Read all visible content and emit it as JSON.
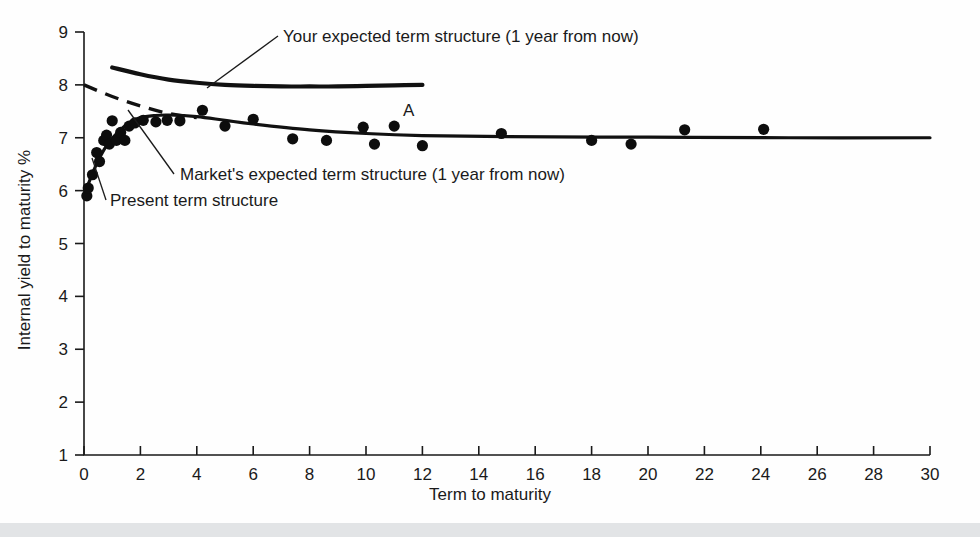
{
  "figure": {
    "background_color": "#fefefe",
    "foreground_color": "#111111",
    "bottom_bar_color": "#e2e4e6"
  },
  "chart_data": {
    "type": "scatter",
    "title": "",
    "xlabel": "Term to maturity",
    "ylabel": "Internal yield to maturity %",
    "xlim": [
      0,
      30
    ],
    "ylim": [
      1,
      9
    ],
    "xticks": [
      0,
      2,
      4,
      6,
      8,
      10,
      12,
      14,
      16,
      18,
      20,
      22,
      24,
      26,
      28,
      30
    ],
    "yticks": [
      1,
      2,
      3,
      4,
      5,
      6,
      7,
      8,
      9
    ],
    "xtick_labels": [
      "0",
      "2",
      "4",
      "6",
      "8",
      "10",
      "12",
      "14",
      "16",
      "18",
      "20",
      "22",
      "24",
      "26",
      "28",
      "30"
    ],
    "ytick_labels": [
      "1",
      "2",
      "3",
      "4",
      "5",
      "6",
      "7",
      "8",
      "9"
    ],
    "grid": false,
    "legend_position": "none",
    "scatter": {
      "name": "Observed bond yields",
      "marker": "filled-circle",
      "color": "#0d0d0d",
      "points": [
        [
          0.1,
          5.9
        ],
        [
          0.15,
          6.05
        ],
        [
          0.3,
          6.3
        ],
        [
          0.45,
          6.72
        ],
        [
          0.55,
          6.55
        ],
        [
          0.7,
          6.95
        ],
        [
          0.8,
          7.05
        ],
        [
          0.9,
          6.88
        ],
        [
          1.0,
          7.32
        ],
        [
          1.15,
          6.95
        ],
        [
          1.3,
          7.1
        ],
        [
          1.45,
          6.95
        ],
        [
          1.6,
          7.22
        ],
        [
          1.8,
          7.28
        ],
        [
          2.1,
          7.33
        ],
        [
          2.55,
          7.3
        ],
        [
          2.95,
          7.33
        ],
        [
          3.4,
          7.32
        ],
        [
          4.2,
          7.52
        ],
        [
          5.0,
          7.22
        ],
        [
          6.0,
          7.35
        ],
        [
          7.4,
          6.98
        ],
        [
          8.6,
          6.95
        ],
        [
          9.9,
          7.2
        ],
        [
          10.3,
          6.88
        ],
        [
          11.0,
          7.22
        ],
        [
          12.0,
          6.85
        ],
        [
          14.8,
          7.08
        ],
        [
          18.0,
          6.95
        ],
        [
          19.4,
          6.88
        ],
        [
          21.3,
          7.15
        ],
        [
          24.1,
          7.16
        ]
      ]
    },
    "series": [
      {
        "name": "Your expected term structure (1 year from now)",
        "style": "solid-thick",
        "x": [
          1.0,
          2.0,
          3.0,
          4.0,
          5.0,
          6.0,
          7.0,
          8.0,
          9.0,
          10.0,
          11.0,
          12.0
        ],
        "y": [
          8.33,
          8.2,
          8.1,
          8.04,
          8.0,
          7.98,
          7.97,
          7.97,
          7.97,
          7.98,
          7.99,
          8.0
        ]
      },
      {
        "name": "Market's expected term structure (1 year from now)",
        "style": "solid-medium",
        "x": [
          0.05,
          0.4,
          0.8,
          1.2,
          1.6,
          2.0,
          2.5,
          3.0,
          4.0,
          5.0,
          6.0,
          8.0,
          10.0,
          12.0,
          15.0,
          20.0,
          25.0,
          30.0
        ],
        "y": [
          5.98,
          6.45,
          6.85,
          7.1,
          7.28,
          7.38,
          7.42,
          7.43,
          7.4,
          7.33,
          7.26,
          7.15,
          7.08,
          7.04,
          7.02,
          7.01,
          7.0,
          7.0
        ]
      },
      {
        "name": "Present term structure",
        "style": "dashed",
        "x": [
          0.0,
          1.0,
          2.0,
          3.0,
          4.0
        ],
        "y": [
          8.0,
          7.78,
          7.6,
          7.46,
          7.38
        ]
      }
    ],
    "annotations": [
      {
        "id": "your-expected",
        "text": "Your expected term structure (1 year from now)",
        "text_x_px": 283,
        "text_y_px": 42,
        "leader": [
          [
            278,
            36
          ],
          [
            207,
            88
          ]
        ]
      },
      {
        "id": "markets-expected",
        "text": "Market's expected term structure (1 year from now)",
        "text_x_px": 180,
        "text_y_px": 180,
        "leader": [
          [
            174,
            174
          ],
          [
            128,
            110
          ]
        ]
      },
      {
        "id": "present-term",
        "text": "Present term structure",
        "text_x_px": 110,
        "text_y_px": 206,
        "leader": [
          [
            106,
            200
          ],
          [
            92,
            158
          ]
        ]
      },
      {
        "id": "point-a",
        "text": "A",
        "text_x_px": 403,
        "text_y_px": 116
      }
    ]
  }
}
